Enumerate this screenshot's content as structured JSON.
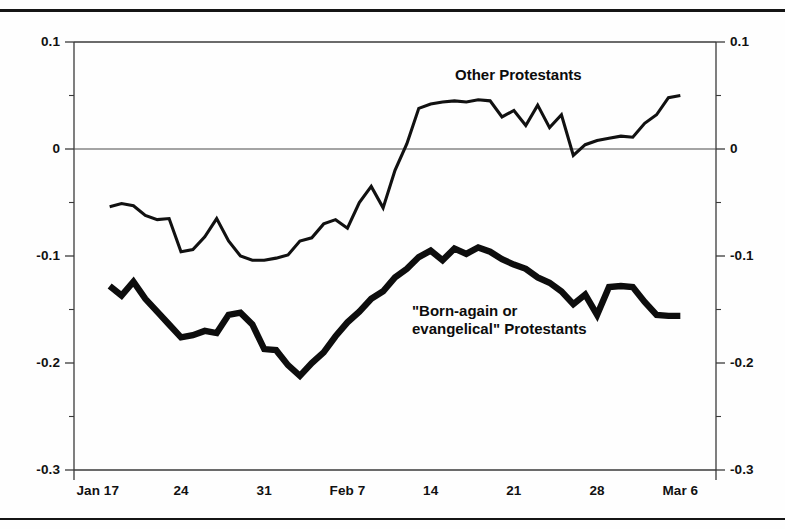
{
  "figure": {
    "frame_color": "#151515",
    "background": "#ffffff"
  },
  "axes": {
    "y_left": {
      "labels": [
        "0.1",
        "0",
        "-0.1",
        "-0.2",
        "-0.3"
      ],
      "values": [
        0.1,
        0,
        -0.1,
        -0.2,
        -0.3
      ]
    },
    "y_right": {
      "labels": [
        "0.1",
        "0",
        "-0.1",
        "-0.2",
        "-0.3"
      ],
      "values": [
        0.1,
        0,
        -0.1,
        -0.2,
        -0.3
      ]
    },
    "x": {
      "labels": [
        "Jan 17",
        "24",
        "31",
        "Feb 7",
        "14",
        "21",
        "28",
        "Mar 6"
      ]
    }
  },
  "series_labels": {
    "other": "Other Protestants",
    "born_again": "\"Born-again or\nevangelical\" Protestants"
  },
  "chart_data": {
    "type": "line",
    "title": "",
    "xlabel": "",
    "ylabel": "",
    "ylim": [
      -0.3,
      0.1
    ],
    "yticks": [
      0.1,
      0.05,
      0,
      -0.05,
      -0.1,
      -0.15,
      -0.2,
      -0.25,
      -0.3
    ],
    "ytick_labels": [
      "0.1",
      "",
      "0",
      "",
      "-0.1",
      "",
      "-0.2",
      "",
      "-0.3"
    ],
    "xtick_labels": [
      "Jan 17",
      "24",
      "31",
      "Feb 7",
      "14",
      "21",
      "28",
      "Mar 6"
    ],
    "xtick_positions": [
      0,
      7,
      14,
      21,
      28,
      35,
      42,
      49
    ],
    "xlim": [
      -2,
      52
    ],
    "grid": false,
    "zero_line": true,
    "legend": "inline-annotations",
    "series": [
      {
        "name": "Other Protestants",
        "style": "thin",
        "color": "#111111",
        "x": [
          1,
          2,
          3,
          4,
          5,
          6,
          7,
          8,
          9,
          10,
          11,
          12,
          13,
          14,
          15,
          16,
          17,
          18,
          19,
          20,
          21,
          22,
          23,
          24,
          25,
          26,
          27,
          28,
          29,
          30,
          31,
          32,
          33,
          34,
          35,
          36,
          37,
          38,
          39,
          40,
          41,
          42,
          43,
          44,
          45,
          46,
          47,
          48,
          49
        ],
        "values": [
          -0.054,
          -0.051,
          -0.053,
          -0.062,
          -0.066,
          -0.065,
          -0.096,
          -0.094,
          -0.082,
          -0.065,
          -0.086,
          -0.1,
          -0.104,
          -0.104,
          -0.102,
          -0.099,
          -0.086,
          -0.083,
          -0.07,
          -0.066,
          -0.074,
          -0.05,
          -0.035,
          -0.055,
          -0.02,
          0.005,
          0.038,
          0.042,
          0.044,
          0.045,
          0.044,
          0.046,
          0.045,
          0.03,
          0.036,
          0.022,
          0.041,
          0.02,
          0.032,
          -0.006,
          0.004,
          0.008,
          0.01,
          0.012,
          0.011,
          0.024,
          0.032,
          0.048,
          0.05
        ]
      },
      {
        "name": "\"Born-again or evangelical\" Protestants",
        "style": "thick",
        "color": "#0d0d0d",
        "x": [
          1,
          2,
          3,
          4,
          5,
          6,
          7,
          8,
          9,
          10,
          11,
          12,
          13,
          14,
          15,
          16,
          17,
          18,
          19,
          20,
          21,
          22,
          23,
          24,
          25,
          26,
          27,
          28,
          29,
          30,
          31,
          32,
          33,
          34,
          35,
          36,
          37,
          38,
          39,
          40,
          41,
          42,
          43,
          44,
          45,
          46,
          47,
          48,
          49
        ],
        "values": [
          -0.128,
          -0.137,
          -0.124,
          -0.14,
          -0.152,
          -0.164,
          -0.176,
          -0.174,
          -0.17,
          -0.172,
          -0.155,
          -0.153,
          -0.164,
          -0.187,
          -0.188,
          -0.202,
          -0.212,
          -0.2,
          -0.19,
          -0.175,
          -0.162,
          -0.152,
          -0.14,
          -0.133,
          -0.12,
          -0.112,
          -0.101,
          -0.095,
          -0.104,
          -0.093,
          -0.098,
          -0.092,
          -0.096,
          -0.103,
          -0.108,
          -0.112,
          -0.12,
          -0.125,
          -0.133,
          -0.145,
          -0.136,
          -0.155,
          -0.129,
          -0.128,
          -0.129,
          -0.143,
          -0.155,
          -0.156,
          -0.156
        ]
      }
    ]
  }
}
